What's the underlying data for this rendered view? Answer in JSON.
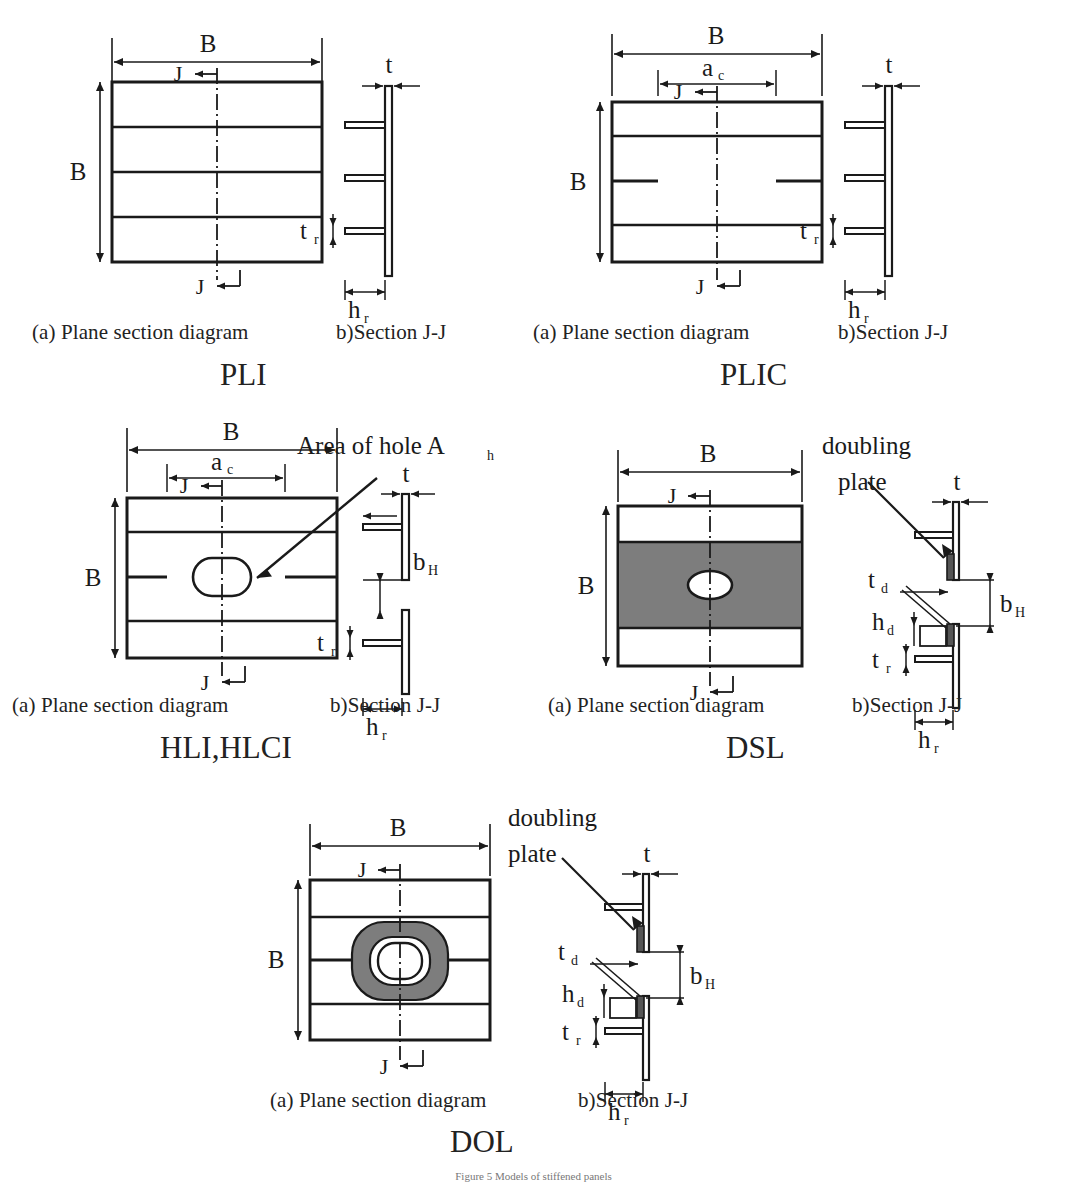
{
  "figure": {
    "caption": "Figure 5 Models of stiffened panels",
    "dimension_symbols": {
      "B": "B",
      "ac": "a",
      "ac_sub": "c",
      "t": "t",
      "tr": "t",
      "tr_sub": "r",
      "hr": "h",
      "hr_sub": "r",
      "bH": "b",
      "bH_sub": "H",
      "td": "t",
      "td_sub": "d",
      "hd": "h",
      "hd_sub": "d",
      "J": "J"
    },
    "annotations": {
      "area_of_hole": "Area of hole A",
      "area_of_hole_sub": "h",
      "doubling_line1": "doubling",
      "doubling_line2": "plate"
    },
    "colors": {
      "line": "#1a1a1a",
      "text": "#1a1a1a",
      "doubling_fill": "#7d7d7d",
      "background": "#ffffff"
    }
  },
  "panels": [
    {
      "id": "pli",
      "model_label": "PLI",
      "plan_caption": "(a) Plane section diagram",
      "section_caption": "b)Section J-J",
      "has_ac": false,
      "has_hole": false,
      "has_doubling": false,
      "cut_stiffener": false,
      "dims": [
        "B",
        "B",
        "t",
        "tr",
        "hr",
        "J"
      ]
    },
    {
      "id": "plic",
      "model_label": "PLIC",
      "plan_caption": "(a) Plane section diagram",
      "section_caption": "b)Section J-J",
      "has_ac": true,
      "has_hole": false,
      "has_doubling": false,
      "cut_stiffener": true,
      "dims": [
        "B",
        "B",
        "ac",
        "t",
        "tr",
        "hr",
        "J"
      ]
    },
    {
      "id": "hli-hlci",
      "model_label": "HLI,HLCI",
      "plan_caption": "(a) Plane section diagram",
      "section_caption": "b)Section J-J",
      "has_ac": true,
      "has_hole": true,
      "has_doubling": false,
      "cut_stiffener": true,
      "dims": [
        "B",
        "B",
        "ac",
        "t",
        "tr",
        "hr",
        "bH",
        "J"
      ]
    },
    {
      "id": "dsl",
      "model_label": "DSL",
      "plan_caption": "(a) Plane section diagram",
      "section_caption": "b)Section J-J",
      "has_ac": false,
      "has_hole": true,
      "has_doubling": true,
      "doubling_shape": "band",
      "cut_stiffener": false,
      "dims": [
        "B",
        "B",
        "t",
        "tr",
        "hr",
        "bH",
        "td",
        "hd",
        "J"
      ]
    },
    {
      "id": "dol",
      "model_label": "DOL",
      "plan_caption": "(a) Plane section diagram",
      "section_caption": "b)Section J-J",
      "has_ac": false,
      "has_hole": true,
      "has_doubling": true,
      "doubling_shape": "ring",
      "cut_stiffener": true,
      "dims": [
        "B",
        "B",
        "t",
        "tr",
        "hr",
        "bH",
        "td",
        "hd",
        "J"
      ]
    }
  ]
}
